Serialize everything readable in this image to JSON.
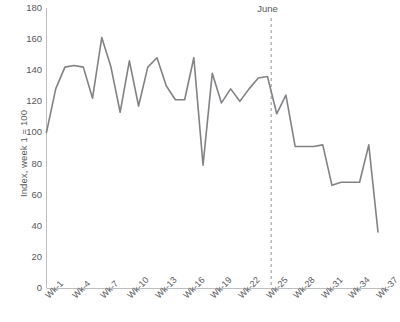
{
  "chart_data": {
    "type": "line",
    "title": "",
    "subtitle": "",
    "xlabel": "",
    "ylabel": "Index, week 1 = 100",
    "ylim": [
      0,
      180
    ],
    "ytick_values": [
      0,
      20,
      40,
      60,
      80,
      100,
      120,
      140,
      160,
      180
    ],
    "ytick_labels": [
      "0",
      "20",
      "40",
      "60",
      "80",
      "100",
      "120",
      "140",
      "160",
      "180"
    ],
    "grid": false,
    "legend": null,
    "legend_position": "none",
    "line_color": "#808285",
    "axis_color": "#bcbec0",
    "text_color": "#58595b",
    "x": [
      1,
      2,
      3,
      4,
      5,
      6,
      7,
      8,
      9,
      10,
      11,
      12,
      13,
      14,
      15,
      16,
      17,
      18,
      19,
      20,
      21,
      22,
      23,
      24,
      25,
      26,
      27,
      28,
      29,
      30,
      31,
      32,
      33,
      34,
      35,
      36,
      37
    ],
    "xtick_positions": [
      1,
      4,
      7,
      10,
      13,
      16,
      19,
      22,
      25,
      28,
      31,
      34,
      37
    ],
    "xtick_labels": [
      "Wk-1",
      "Wk-4",
      "Wk-7",
      "Wk-10",
      "Wk-13",
      "Wk-16",
      "Wk-19",
      "Wk-22",
      "Wk-25",
      "Wk-28",
      "Wk-31",
      "Wk-34",
      "Wk-37"
    ],
    "values": [
      100,
      128,
      142,
      143,
      142,
      122,
      161,
      142,
      113,
      146,
      117,
      142,
      148,
      130,
      121,
      121,
      148,
      79,
      138,
      119,
      128,
      120,
      128,
      135,
      136,
      112,
      124,
      91,
      91,
      91,
      92,
      66,
      68,
      68,
      68,
      92,
      36
    ],
    "series": [
      {
        "name": "Index",
        "values": [
          100,
          128,
          142,
          143,
          142,
          122,
          161,
          142,
          113,
          146,
          117,
          142,
          148,
          130,
          121,
          121,
          148,
          79,
          138,
          119,
          128,
          120,
          128,
          135,
          136,
          112,
          124,
          91,
          91,
          91,
          92,
          66,
          68,
          68,
          68,
          92,
          36
        ]
      }
    ],
    "annotations": [
      {
        "type": "vline",
        "label": "June",
        "x": 25.4,
        "style": "dashed",
        "color": "#939598"
      }
    ]
  }
}
